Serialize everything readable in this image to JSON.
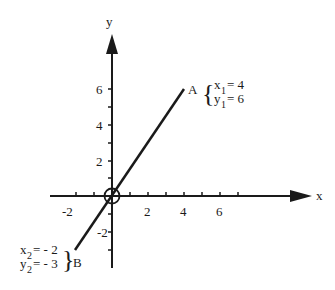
{
  "diagram": {
    "axes": {
      "x_label": "x",
      "y_label": "y",
      "x_ticks": [
        {
          "value": -2,
          "label": "-2"
        },
        {
          "value": 2,
          "label": "2"
        },
        {
          "value": 4,
          "label": "4"
        },
        {
          "value": 6,
          "label": "6"
        }
      ],
      "y_ticks": [
        {
          "value": 6,
          "label": "6"
        },
        {
          "value": 4,
          "label": "4"
        },
        {
          "value": 2,
          "label": "2"
        },
        {
          "value": -2,
          "label": "-2"
        }
      ]
    },
    "points": {
      "A": {
        "name": "A",
        "x_sym": "x",
        "x_sub": "1",
        "x_val": "= 4",
        "y_sym": "y",
        "y_sub": "1",
        "y_val": "= 6"
      },
      "B": {
        "name": "B",
        "x_sym": "x",
        "x_sub": "2",
        "x_val": "= - 2",
        "y_sym": "y",
        "y_sub": "2",
        "y_val": "= - 3"
      }
    },
    "line": {
      "from": "B",
      "to": "A",
      "through_origin": true
    },
    "origin_marker": "circle"
  }
}
